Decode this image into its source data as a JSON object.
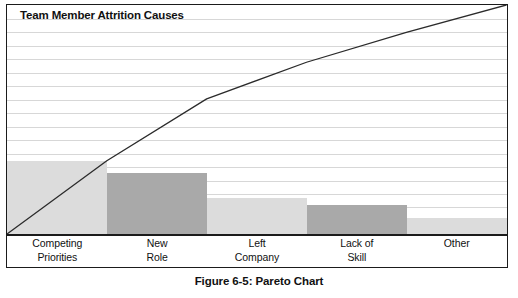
{
  "figure": {
    "caption": "Figure 6-5: Pareto Chart"
  },
  "chart_data": {
    "type": "bar",
    "title": "Team Member Attrition Causes",
    "xlabel": "",
    "ylabel": "",
    "categories": [
      "Competing Priorities",
      "New Role",
      "Left Company",
      "Lack of Skill",
      "Other"
    ],
    "category_lines": [
      [
        "Competing",
        "Priorities"
      ],
      [
        "New",
        "Role"
      ],
      [
        "Left",
        "Company"
      ],
      [
        "Lack of",
        "Skill"
      ],
      [
        "Other",
        ""
      ]
    ],
    "values": [
      32,
      27,
      16,
      13,
      7
    ],
    "cumulative_percent": [
      32,
      59,
      75,
      88,
      100
    ],
    "ylim": [
      0,
      100
    ],
    "grid": true,
    "gridline_count": 16,
    "legend": "none",
    "series": [
      {
        "name": "Cause frequency",
        "type": "bar",
        "values": [
          32,
          27,
          16,
          13,
          7
        ]
      },
      {
        "name": "Cumulative percentage",
        "type": "line",
        "values": [
          32,
          59,
          75,
          88,
          100
        ]
      }
    ],
    "bar_colors": [
      "#dcdcdc",
      "#a9a9a9",
      "#dcdcdc",
      "#a9a9a9",
      "#dcdcdc"
    ],
    "line_color": "#2b2b2b",
    "grid_color": "#d7d7d7",
    "frame_color": "#1b1b1b",
    "background": "#ffffff"
  }
}
